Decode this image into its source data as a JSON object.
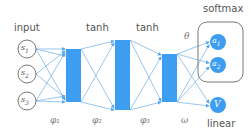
{
  "colors": {
    "accent": "#3d9df0",
    "edge": "#7fb8ea",
    "stroke": "#555555",
    "text": "#555555"
  },
  "labels": {
    "input": "input",
    "tanh_1": "tanh",
    "tanh_2": "tanh",
    "softmax": "softmax",
    "linear": "linear",
    "theta": "θ"
  },
  "inputs": [
    {
      "id": "s1",
      "label": "s",
      "sub": "1"
    },
    {
      "id": "s2",
      "label": "s",
      "sub": "2"
    },
    {
      "id": "s3",
      "label": "s",
      "sub": "3"
    }
  ],
  "weights": {
    "phi_1": "φ₁",
    "phi_2": "φ₂",
    "phi_3": "φ₃",
    "omega": "ω"
  },
  "outputs": [
    {
      "id": "a1",
      "label": "a",
      "sub": "1",
      "group": "softmax"
    },
    {
      "id": "a2",
      "label": "a",
      "sub": "2",
      "group": "softmax"
    },
    {
      "id": "V",
      "label": "V",
      "sub": "",
      "group": "linear"
    }
  ]
}
